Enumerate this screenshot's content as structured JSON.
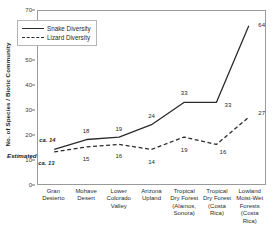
{
  "chart_data": {
    "type": "line",
    "title": "",
    "xlabel": "",
    "ylabel": "No. of Species / Biotic Community",
    "ylim": [
      0,
      70
    ],
    "yticks": [
      0,
      10,
      20,
      30,
      40,
      50,
      60,
      70
    ],
    "grid": false,
    "legend_position": "top-left",
    "categories": [
      "Gran Desierto",
      "Mohave Desert",
      "Lower Colorado Valley",
      "Arizona Upland",
      "Tropical Dry Forest (Alamos, Sonora)",
      "Tropical Dry Forest (Costa Rica)",
      "Lowland Moist-Wet Forests (Costa Rica)"
    ],
    "category_lines": [
      [
        "Gran",
        "Desierto"
      ],
      [
        "Mohave",
        "Desert"
      ],
      [
        "Lower",
        "Colorado",
        "Valley"
      ],
      [
        "Arizona",
        "Upland"
      ],
      [
        "Tropical",
        "Dry Forest",
        "(Alamos,",
        "Sonora)"
      ],
      [
        "Tropical",
        "Dry Forest",
        "(Costa",
        "Rica)"
      ],
      [
        "Lowland",
        "Moist-Wet",
        "Forests",
        "(Costa",
        "Rica)"
      ]
    ],
    "series": [
      {
        "name": "Snake Diversity",
        "style": "solid",
        "color": "#2b2b2b",
        "values": [
          14,
          18,
          19,
          24,
          33,
          33,
          64
        ],
        "labels": [
          "ca. 14",
          "18",
          "19",
          "24",
          "33",
          "33",
          "64"
        ],
        "estimated_flags": [
          true,
          false,
          false,
          false,
          false,
          false,
          false
        ]
      },
      {
        "name": "Lizard Diversity",
        "style": "dashed",
        "color": "#2b2b2b",
        "values": [
          13,
          15,
          16,
          14,
          19,
          16,
          27
        ],
        "labels": [
          "ca. 13",
          "15",
          "16",
          "14",
          "19",
          "16",
          "27"
        ],
        "estimated_flags": [
          true,
          false,
          false,
          false,
          false,
          false,
          false
        ]
      }
    ],
    "annotations": [
      {
        "text": "Estimated",
        "style": "italic-bold"
      }
    ]
  },
  "legend": {
    "items": [
      {
        "label": "Snake Diversity",
        "style": "solid"
      },
      {
        "label": "Lizard Diversity",
        "style": "dashed"
      }
    ]
  },
  "axis": {
    "y_title": "No. of Species / Biotic Community"
  },
  "notes": {
    "estimated": "Estimated"
  }
}
